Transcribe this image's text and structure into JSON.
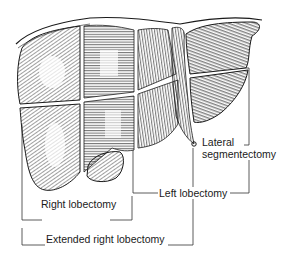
{
  "figure": {
    "colors": {
      "ink": "#1a1a1a",
      "shade": "#555555",
      "background": "#ffffff"
    }
  },
  "labels": {
    "lateral_segmentectomy_line1": "Lateral",
    "lateral_segmentectomy_line2": "segmentectomy",
    "left_lobectomy": "Left lobectomy",
    "right_lobectomy": "Right lobectomy",
    "extended_right_lobectomy": "Extended right lobectomy"
  }
}
